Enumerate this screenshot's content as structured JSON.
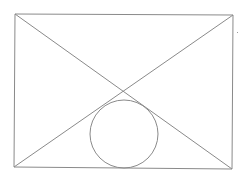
{
  "diagram": {
    "width": 246,
    "height": 181,
    "background": "#ffffff",
    "stroke_color": "#8a8a8a",
    "stroke_width": 1,
    "rectangle": {
      "top_left": [
        15,
        14
      ],
      "top_right": [
        233,
        15
      ],
      "bottom_right": [
        232,
        169
      ],
      "bottom_left": [
        14,
        167
      ]
    },
    "diagonals": [
      {
        "from": [
          15,
          14
        ],
        "to": [
          232,
          169
        ]
      },
      {
        "from": [
          233,
          15
        ],
        "to": [
          14,
          167
        ]
      }
    ],
    "intersection": [
      124,
      92
    ],
    "circle": {
      "cx": 124,
      "cy": 134,
      "r": 34
    },
    "speck": {
      "x": 237,
      "y": 32
    }
  }
}
